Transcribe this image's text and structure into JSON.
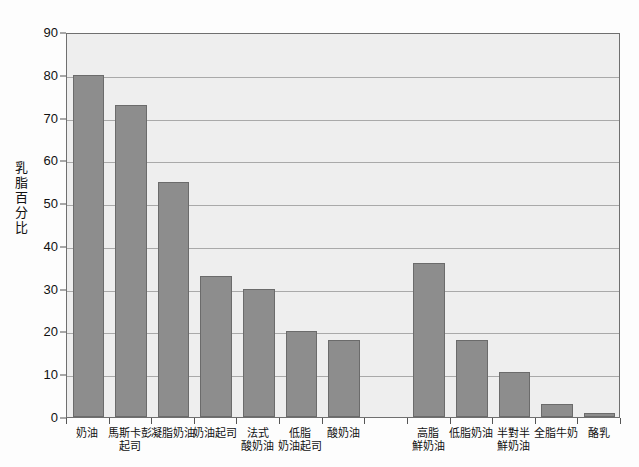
{
  "chart_data": {
    "type": "bar",
    "title": "",
    "subtitle": "",
    "xlabel": "",
    "ylabel": "乳脂百分比",
    "ylim": [
      0,
      90
    ],
    "ytick_step": 10,
    "yticks": [
      0,
      10,
      20,
      30,
      40,
      50,
      60,
      70,
      80,
      90
    ],
    "grid": true,
    "legend": "none",
    "bar_color": "#8d8d8d",
    "bar_edge_color": "#6b6b6b",
    "plot_background": "#eeeeee",
    "gridline_color": "#a9a9a9",
    "axis_color": "#6f6f6f",
    "categories": [
      "奶油",
      "馬斯卡彭起司",
      "凝脂奶油",
      "奶油起司",
      "法式酸奶油",
      "低脂奶油起司",
      "酸奶油",
      "",
      "高脂鮮奶油",
      "低脂奶油",
      "半對半鮮奶油",
      "全脂牛奶",
      "酪乳"
    ],
    "category_lines": [
      [
        "奶油"
      ],
      [
        "馬斯卡彭",
        "起司"
      ],
      [
        "凝脂奶油"
      ],
      [
        "奶油起司"
      ],
      [
        "法式",
        "酸奶油"
      ],
      [
        "低脂",
        "奶油起司"
      ],
      [
        "酸奶油"
      ],
      [
        ""
      ],
      [
        "高脂",
        "鮮奶油"
      ],
      [
        "低脂奶油"
      ],
      [
        "半對半",
        "鮮奶油"
      ],
      [
        "全脂牛奶"
      ],
      [
        "酪乳"
      ]
    ],
    "values": [
      80,
      73,
      55,
      33,
      30,
      20,
      18,
      null,
      36,
      18,
      10.5,
      3,
      1
    ]
  }
}
